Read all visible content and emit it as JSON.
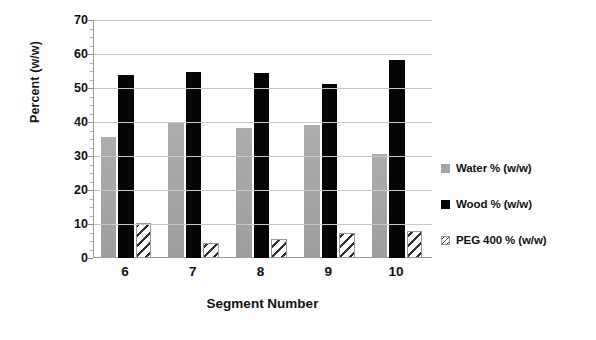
{
  "chart_data": {
    "type": "bar",
    "title": "",
    "xlabel": "Segment Number",
    "ylabel": "Percent (w/w)",
    "categories": [
      "6",
      "7",
      "8",
      "9",
      "10"
    ],
    "series": [
      {
        "name": "Water % (w/w)",
        "color": "#a6a6a6",
        "fill": "solid-gray",
        "values": [
          35.6,
          39.8,
          38.3,
          39.2,
          30.7
        ]
      },
      {
        "name": "Wood % (w/w)",
        "color": "#050505",
        "fill": "solid-black",
        "values": [
          53.8,
          54.6,
          54.3,
          51.2,
          58.3
        ]
      },
      {
        "name": "PEG 400 % (w/w)",
        "color": "#303030",
        "fill": "diagonal-hatch",
        "values": [
          10.2,
          4.5,
          5.5,
          7.3,
          8.0
        ]
      }
    ],
    "ylim": [
      0,
      70
    ],
    "yticks": [
      0,
      10,
      20,
      30,
      40,
      50,
      60,
      70
    ],
    "ytick_labels": [
      "0",
      "10",
      "20",
      "30",
      "40",
      "50",
      "60",
      "70"
    ],
    "minor_tick_interval": 2.5,
    "grid": "horizontal",
    "legend_position": "right"
  },
  "legend": {
    "items": [
      {
        "label": "Water % (w/w)",
        "swatch": "water-swatch-icon"
      },
      {
        "label": "Wood % (w/w)",
        "swatch": "wood-swatch-icon"
      },
      {
        "label": "PEG 400 % (w/w)",
        "swatch": "peg-swatch-icon"
      }
    ]
  }
}
